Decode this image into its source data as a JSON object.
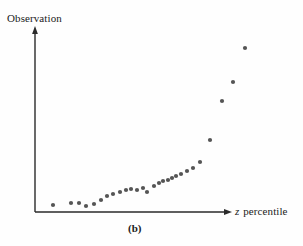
{
  "figure": {
    "caption": "(b)",
    "y_axis_label": "Observation",
    "x_axis_label_variable": "z",
    "x_axis_label_rest": " percentile",
    "background_color": "#fefefe",
    "axis_color": "#2a2a2a",
    "marker_color": "#555555"
  },
  "chart_data": {
    "type": "scatter",
    "title": "",
    "subtitle": "",
    "caption": "(b)",
    "xlabel": "z percentile",
    "ylabel": "Observation",
    "xlim": [
      0,
      100
    ],
    "ylim": [
      0,
      100
    ],
    "grid": false,
    "legend": null,
    "axis_ticks": {
      "x": [],
      "y": []
    },
    "annotations": [],
    "series": [
      {
        "name": "Observations",
        "color": "#555555",
        "marker": "circle",
        "points": [
          {
            "x": 7.0,
            "y": 3.5
          },
          {
            "x": 16.8,
            "y": 4.8
          },
          {
            "x": 21.1,
            "y": 4.8
          },
          {
            "x": 24.9,
            "y": 2.9
          },
          {
            "x": 29.2,
            "y": 4.2
          },
          {
            "x": 32.9,
            "y": 6.7
          },
          {
            "x": 36.2,
            "y": 9.3
          },
          {
            "x": 39.4,
            "y": 10.5
          },
          {
            "x": 43.2,
            "y": 11.8
          },
          {
            "x": 46.5,
            "y": 13.0
          },
          {
            "x": 49.2,
            "y": 13.7
          },
          {
            "x": 52.4,
            "y": 13.0
          },
          {
            "x": 55.7,
            "y": 14.3
          },
          {
            "x": 57.8,
            "y": 11.8
          },
          {
            "x": 61.6,
            "y": 15.6
          },
          {
            "x": 64.3,
            "y": 17.5
          },
          {
            "x": 66.5,
            "y": 18.7
          },
          {
            "x": 69.2,
            "y": 19.3
          },
          {
            "x": 71.4,
            "y": 20.6
          },
          {
            "x": 73.5,
            "y": 21.9
          },
          {
            "x": 76.2,
            "y": 23.1
          },
          {
            "x": 79.5,
            "y": 25.0
          },
          {
            "x": 82.7,
            "y": 26.9
          },
          {
            "x": 86.5,
            "y": 30.6
          },
          {
            "x": 91.9,
            "y": 44.4
          },
          {
            "x": 98.4,
            "y": 68.7
          },
          {
            "x": 104.3,
            "y": 80.6
          },
          {
            "x": 110.8,
            "y": 101.9
          }
        ]
      }
    ]
  },
  "plot_geometry": {
    "y_axis_x": 35,
    "y_axis_top": 30,
    "x_axis_y": 212,
    "x_axis_right": 228,
    "marker_radius": 2.1,
    "pixel_points": [
      [
        53,
        205
      ],
      [
        71,
        203
      ],
      [
        79,
        203
      ],
      [
        86,
        206
      ],
      [
        94,
        204
      ],
      [
        101,
        200
      ],
      [
        107,
        196
      ],
      [
        113,
        194
      ],
      [
        120,
        192
      ],
      [
        126,
        190
      ],
      [
        131,
        189
      ],
      [
        137,
        190
      ],
      [
        143,
        188
      ],
      [
        147,
        192
      ],
      [
        154,
        186
      ],
      [
        159,
        183
      ],
      [
        163,
        181
      ],
      [
        168,
        180
      ],
      [
        172,
        178
      ],
      [
        176,
        176
      ],
      [
        181,
        174
      ],
      [
        187,
        171
      ],
      [
        193,
        168
      ],
      [
        200,
        162
      ],
      [
        210,
        140
      ],
      [
        222,
        101
      ],
      [
        233,
        82
      ],
      [
        245,
        48
      ]
    ]
  }
}
